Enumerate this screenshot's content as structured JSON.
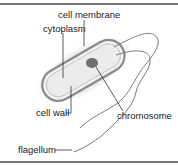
{
  "diagram": {
    "labels": {
      "cell_membrane": "cell membrane",
      "cytoplasm": "cytoplasm",
      "cell_wall": "cell wall",
      "chromosome": "chromosome",
      "flagellum": "flagellum"
    },
    "colors": {
      "capsule": "#e6e6e6",
      "wall": "#8a8a8a",
      "cytoplasm": "#eeeeee",
      "chromosome": "#6e6e6e",
      "flagellum": "#7a7a7a",
      "rule": "#777777"
    }
  }
}
